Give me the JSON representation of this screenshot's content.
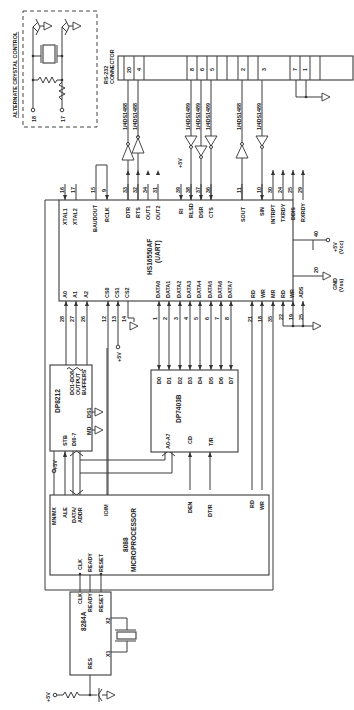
{
  "diagram": {
    "orientation": "rotated 90 degrees clockwise",
    "alt_crystal": {
      "label": "ALTERNATE CRYSTAL CONTROL",
      "pins": [
        "18",
        "17"
      ]
    },
    "rs232": {
      "label_line1": "RS-232",
      "label_line2": "CONNECTOR",
      "pins": [
        "20",
        "4",
        "8",
        "6",
        "5",
        "2",
        "3",
        "7",
        "1"
      ]
    },
    "drivers": {
      "label_1488": "1/4DS1488",
      "label_1489": "1/4DS1489",
      "vcc": "+5V"
    },
    "uart": {
      "name": "HS16550AF",
      "sub": "(UART)",
      "top_pins": [
        {
          "num": "16",
          "name": "XTAL1"
        },
        {
          "num": "17",
          "name": "XTAL2"
        },
        {
          "num": "15",
          "name": "BAUDOUT"
        },
        {
          "num": "9",
          "name": "RCLK"
        },
        {
          "num": "33",
          "name": "DTR"
        },
        {
          "num": "32",
          "name": "RTS"
        },
        {
          "num": "34",
          "name": "OUT1"
        },
        {
          "num": "31",
          "name": "OUT2"
        },
        {
          "num": "39",
          "name": "RI"
        },
        {
          "num": "38",
          "name": "RLSD"
        },
        {
          "num": "37",
          "name": "DSR"
        },
        {
          "num": "36",
          "name": "CTS"
        },
        {
          "num": "11",
          "name": "SOUT"
        },
        {
          "num": "10",
          "name": "SIN"
        },
        {
          "num": "30",
          "name": "INTRPT"
        },
        {
          "num": "24",
          "name": "TXRDY"
        },
        {
          "num": "25",
          "name": "DDIS"
        },
        {
          "num": "29",
          "name": "RXRDY"
        }
      ],
      "bottom_pins": [
        {
          "num": "28",
          "name": "A0"
        },
        {
          "num": "27",
          "name": "A1"
        },
        {
          "num": "26",
          "name": "A2"
        },
        {
          "num": "12",
          "name": "CS0"
        },
        {
          "num": "13",
          "name": "CS1"
        },
        {
          "num": "14",
          "name": "CS2"
        },
        {
          "num": "1",
          "name": "DATA0"
        },
        {
          "num": "2",
          "name": "DATA1"
        },
        {
          "num": "3",
          "name": "DATA2"
        },
        {
          "num": "4",
          "name": "DATA3"
        },
        {
          "num": "5",
          "name": "DATA4"
        },
        {
          "num": "6",
          "name": "DATA5"
        },
        {
          "num": "7",
          "name": "DATA6"
        },
        {
          "num": "8",
          "name": "DATA7"
        },
        {
          "num": "21",
          "name": "RD"
        },
        {
          "num": "18",
          "name": "WR"
        },
        {
          "num": "35",
          "name": "MR"
        },
        {
          "num": "22",
          "name": "RD"
        },
        {
          "num": "19",
          "name": "WR"
        },
        {
          "num": "25",
          "name": "ADS"
        }
      ],
      "right_pins": [
        {
          "num": "40",
          "label1": "+5V",
          "label2": "(Vcc)"
        },
        {
          "num": "20",
          "label1": "GND",
          "label2": "(Vss)"
        }
      ],
      "cs_vcc": "+5V"
    },
    "latch": {
      "name": "DP8212",
      "outputs": [
        "DO1-DO8",
        "OUTPUT",
        "BUFFERS"
      ],
      "pins": [
        "STB",
        "DI0-7",
        "MD",
        "DS1"
      ],
      "vcc": "+5V"
    },
    "transceiver": {
      "name": "DP7403B",
      "data_pins": [
        "D0",
        "D1",
        "D2",
        "D3",
        "D4",
        "D5",
        "D6",
        "D7"
      ],
      "pins": [
        "A0-A7",
        "CD",
        "T/R"
      ]
    },
    "cpu": {
      "name": "8088",
      "sub": "MICROPROCESSOR",
      "pins": [
        "MN/MX",
        "ALE",
        "DATA/",
        "ADDR",
        "IO/M",
        "DEN",
        "DT/R",
        "RD",
        "WR",
        "CLK",
        "READY",
        "RESET"
      ],
      "vcc": "+5V"
    },
    "clockgen": {
      "name": "8284A",
      "pins": [
        "CLK",
        "READY",
        "RESET",
        "X2",
        "X1",
        "RES"
      ],
      "vcc": "+5V"
    }
  }
}
